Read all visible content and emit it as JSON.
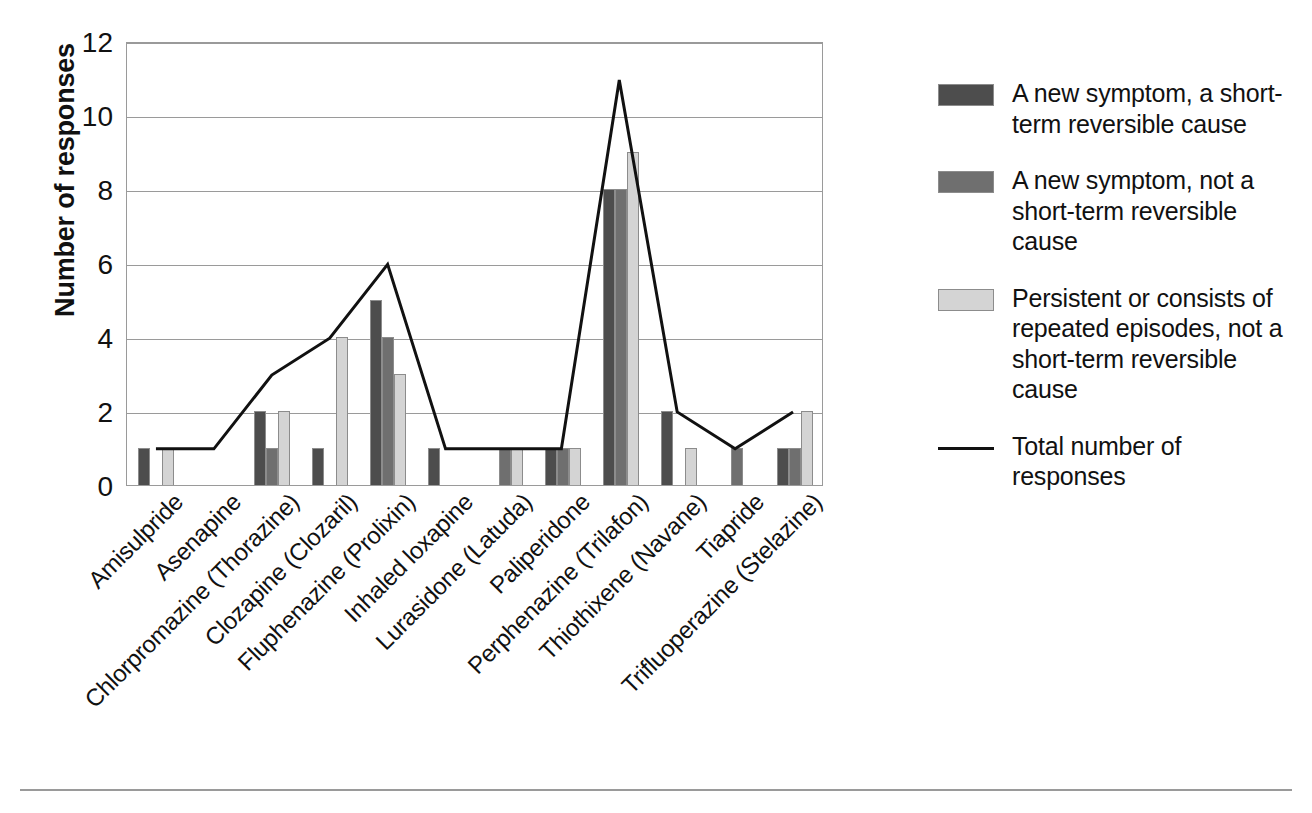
{
  "chart_data": {
    "type": "bar",
    "title": "",
    "xlabel": "",
    "ylabel": "Number of responses",
    "ylim": [
      0,
      12
    ],
    "yticks": [
      0,
      2,
      4,
      6,
      8,
      10,
      12
    ],
    "grid": true,
    "legend_position": "right",
    "categories": [
      "Amisulpride",
      "Asenapine",
      "Chlorpromazine (Thorazine)",
      "Clozapine (Clozaril)",
      "Fluphenazine (Prolixin)",
      "Inhaled loxapine",
      "Lurasidone (Latuda)",
      "Paliperidone",
      "Perphenazine (Trilafon)",
      "Thiothixene (Navane)",
      "Tiapride",
      "Trifluoperazine (Stelazine)"
    ],
    "series": [
      {
        "name": "A new symptom, a short-term reversible cause",
        "type": "bar",
        "color": "#4d4d4d",
        "values": [
          1,
          0,
          2,
          1,
          5,
          1,
          0,
          1,
          8,
          2,
          0,
          1
        ]
      },
      {
        "name": "A new symptom, not a short-term reversible cause",
        "type": "bar",
        "color": "#6f6f6f",
        "values": [
          0,
          0,
          1,
          0,
          4,
          0,
          1,
          1,
          8,
          0,
          1,
          1
        ]
      },
      {
        "name": "Persistent or consists of repeated episodes, not a short-term reversible cause",
        "type": "bar",
        "color": "#d4d4d4",
        "values": [
          1,
          0,
          2,
          4,
          3,
          0,
          1,
          1,
          9,
          1,
          0,
          2
        ]
      },
      {
        "name": "Total number of responses",
        "type": "line",
        "color": "#111111",
        "values": [
          1,
          1,
          3,
          4,
          6,
          1,
          1,
          1,
          11,
          2,
          1,
          2
        ]
      }
    ]
  },
  "legend": {
    "entries": [
      {
        "marker": "swatch",
        "label": "A new symptom, a short-term reversible cause"
      },
      {
        "marker": "swatch",
        "label": "A new symptom, not a short-term reversible cause"
      },
      {
        "marker": "swatch",
        "label": "Persistent or consists of repeated episodes, not a short-term reversible cause"
      },
      {
        "marker": "line",
        "label": "Total number of responses"
      }
    ]
  },
  "axis": {
    "y_title": "Number of responses",
    "y_tick_labels": [
      "0",
      "2",
      "4",
      "6",
      "8",
      "10",
      "12"
    ]
  }
}
